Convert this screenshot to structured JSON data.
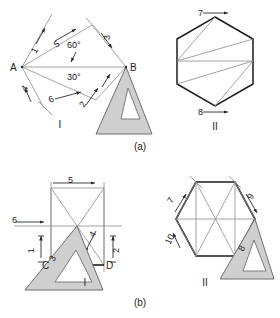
{
  "figure": {
    "title_caption_a": "(a)",
    "title_caption_b": "(b)",
    "colors": {
      "background": "#ffffff",
      "ink": "#2b2b2b",
      "thin_line": "#8d8d8d",
      "heavy_line": "#1c1c1c",
      "ruler_fill": "#cfcfcf",
      "ruler_edge": "#6f6f6f",
      "text": "#222222"
    }
  },
  "panels": [
    {
      "id": "a-I",
      "roman": "I",
      "caption": "(a)",
      "points": [
        {
          "name": "A",
          "label": "A"
        },
        {
          "name": "B",
          "label": "B"
        }
      ],
      "angles": [
        {
          "label": "60°"
        },
        {
          "label": "30°"
        }
      ],
      "stroke_numbers": [
        "1",
        "5",
        "3",
        "4",
        "6",
        "2"
      ],
      "has_ruler": true
    },
    {
      "id": "a-II",
      "roman": "II",
      "caption": "(a)",
      "stroke_numbers": [
        "7",
        "8"
      ],
      "has_ruler": false
    },
    {
      "id": "b-I",
      "roman": "I",
      "caption": "(b)",
      "points": [
        {
          "name": "C",
          "label": "C"
        },
        {
          "name": "D",
          "label": "D"
        }
      ],
      "stroke_numbers": [
        "5",
        "6",
        "3",
        "4",
        "1",
        "2"
      ],
      "has_ruler": true
    },
    {
      "id": "b-II",
      "roman": "II",
      "caption": "(b)",
      "stroke_numbers": [
        "7",
        "9",
        "10",
        "8"
      ],
      "has_ruler": true
    }
  ],
  "labels": {
    "a_I_roman": "I",
    "a_II_roman": "II",
    "b_I_roman": "I",
    "b_II_roman": "II",
    "caption_a": "(a)",
    "caption_b": "(b)",
    "pt_A": "A",
    "pt_B": "B",
    "pt_C": "C",
    "pt_D": "D",
    "ang_60": "60°",
    "ang_30": "30°",
    "n1": "1",
    "n2": "2",
    "n3": "3",
    "n4": "4",
    "n5": "5",
    "n6": "6",
    "n7": "7",
    "n8": "8",
    "n9": "9",
    "n10": "10",
    "b1_n5": "5",
    "b1_n6": "6",
    "b1_n3": "3",
    "b1_n4": "4",
    "b1_n1": "1",
    "b1_n2": "2",
    "h1_n7": "7",
    "h1_n8": "8",
    "h2_n7": "7",
    "h2_n8": "8",
    "h2_n9": "9",
    "h2_n10": "10"
  }
}
